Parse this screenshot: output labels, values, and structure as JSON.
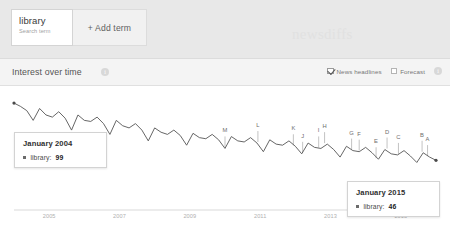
{
  "topbar": {
    "term": {
      "label": "library",
      "sublabel": "Search term"
    },
    "add_term_label": "+ Add term",
    "watermark": "newsdiffs"
  },
  "section": {
    "title": "Interest over time",
    "info_icon": "i",
    "options": [
      {
        "label": "News headlines",
        "checked": true,
        "icon": "checkbox-checked-icon"
      },
      {
        "label": "Forecast",
        "checked": false,
        "icon": "checkbox-icon"
      }
    ],
    "options_info_icon": "i"
  },
  "tooltips": [
    {
      "date": "January 2004",
      "series": "library:",
      "value": "99"
    },
    {
      "date": "January 2015",
      "series": "library:",
      "value": "46"
    }
  ],
  "chart_data": {
    "type": "line",
    "title": "Interest over time",
    "xlabel": "",
    "ylabel": "",
    "ylim": [
      0,
      100
    ],
    "grid": false,
    "legend": "none",
    "series_name": "library",
    "line_color": "#555555",
    "xticks": [
      "2005",
      "2007",
      "2009",
      "2011",
      "2013",
      "2015"
    ],
    "x": [
      "2004-01",
      "2004-03",
      "2004-05",
      "2004-07",
      "2004-09",
      "2004-11",
      "2005-01",
      "2005-03",
      "2005-05",
      "2005-07",
      "2005-09",
      "2005-11",
      "2006-01",
      "2006-03",
      "2006-05",
      "2006-07",
      "2006-09",
      "2006-11",
      "2007-01",
      "2007-03",
      "2007-05",
      "2007-07",
      "2007-09",
      "2007-11",
      "2008-01",
      "2008-03",
      "2008-05",
      "2008-07",
      "2008-09",
      "2008-11",
      "2009-01",
      "2009-03",
      "2009-05",
      "2009-07",
      "2009-09",
      "2009-11",
      "2010-01",
      "2010-03",
      "2010-05",
      "2010-07",
      "2010-09",
      "2010-11",
      "2011-01",
      "2011-03",
      "2011-05",
      "2011-07",
      "2011-09",
      "2011-11",
      "2012-01",
      "2012-03",
      "2012-05",
      "2012-07",
      "2012-09",
      "2012-11",
      "2013-01",
      "2013-03",
      "2013-05",
      "2013-07",
      "2013-09",
      "2013-11",
      "2014-01",
      "2014-03",
      "2014-05",
      "2014-07",
      "2014-09",
      "2014-11",
      "2015-01"
    ],
    "values": [
      99,
      96,
      92,
      83,
      94,
      88,
      86,
      91,
      85,
      74,
      88,
      83,
      82,
      86,
      80,
      70,
      83,
      78,
      76,
      80,
      74,
      64,
      76,
      72,
      70,
      74,
      69,
      60,
      71,
      67,
      66,
      70,
      65,
      57,
      68,
      64,
      63,
      67,
      62,
      54,
      65,
      61,
      60,
      64,
      59,
      52,
      62,
      58,
      57,
      61,
      56,
      49,
      59,
      55,
      54,
      58,
      53,
      47,
      56,
      52,
      51,
      55,
      50,
      44,
      53,
      49,
      46
    ],
    "annotations": [
      {
        "letter": "M",
        "x_frac": 0.5
      },
      {
        "letter": "L",
        "x_frac": 0.578
      },
      {
        "letter": "K",
        "x_frac": 0.662
      },
      {
        "letter": "J",
        "x_frac": 0.684
      },
      {
        "letter": "I",
        "x_frac": 0.722
      },
      {
        "letter": "H",
        "x_frac": 0.736
      },
      {
        "letter": "G",
        "x_frac": 0.8
      },
      {
        "letter": "F",
        "x_frac": 0.818
      },
      {
        "letter": "E",
        "x_frac": 0.858
      },
      {
        "letter": "D",
        "x_frac": 0.884
      },
      {
        "letter": "C",
        "x_frac": 0.911
      },
      {
        "letter": "B",
        "x_frac": 0.967
      },
      {
        "letter": "A",
        "x_frac": 0.98
      }
    ]
  }
}
